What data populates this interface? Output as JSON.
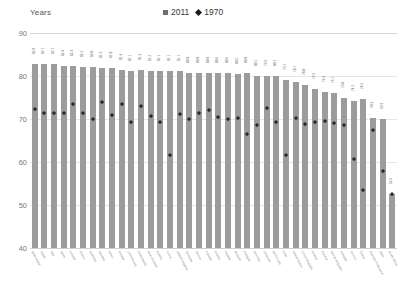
{
  "axis_title": "Years",
  "legend": [
    {
      "label": "2011",
      "marker": "square-icon",
      "color": "#6e6e6e"
    },
    {
      "label": "1970",
      "marker": "diamond-icon",
      "color": "#1a1a1a"
    }
  ],
  "y_ticks": [
    "90",
    "80",
    "70",
    "60",
    "50",
    "40"
  ],
  "chart_data": {
    "type": "bar",
    "title": "",
    "xlabel": "",
    "ylabel": "Years",
    "ylim": [
      40,
      90
    ],
    "yticks": [
      40,
      50,
      60,
      70,
      80,
      90
    ],
    "grid": true,
    "legend_position": "top-center",
    "categories": [
      "Switzerland",
      "Japan",
      "Italy",
      "Spain",
      "Iceland",
      "France",
      "Australia",
      "Sweden",
      "Israel",
      "Norway",
      "Luxembourg",
      "Netherlands",
      "New Zealand",
      "Austria",
      "Korea",
      "United Kingdom",
      "Germany",
      "Greece",
      "Canada",
      "Ireland",
      "Finland",
      "Belgium",
      "Portugal",
      "Slovenia",
      "Denmark",
      "OECD (34)",
      "Chile",
      "United States",
      "Czech Republic",
      "Poland",
      "Estonia",
      "Slovak Republic",
      "Hungary",
      "Mexico",
      "Turkey",
      "Russian Federation",
      "India",
      "South Africa"
    ],
    "series": [
      {
        "name": "2011",
        "type": "bar",
        "color": "#9c9c9c",
        "values": [
          82.8,
          82.7,
          82.7,
          82.4,
          82.4,
          82.2,
          82.0,
          81.9,
          81.8,
          81.4,
          81.1,
          81.3,
          81.2,
          81.1,
          81.1,
          81.1,
          80.8,
          80.8,
          80.8,
          80.6,
          80.6,
          80.5,
          80.8,
          80.1,
          79.9,
          80.1,
          79.1,
          78.7,
          78.0,
          76.9,
          76.3,
          76.1,
          75.0,
          74.2,
          74.6,
          70.3,
          69.9,
          52.6
        ]
      },
      {
        "name": "1970",
        "type": "marker",
        "color": "#2a2a2a",
        "values": [
          73.0,
          72.0,
          72.0,
          72.0,
          74.3,
          72.2,
          70.8,
          74.7,
          71.6,
          74.1,
          70.0,
          73.7,
          71.4,
          70.0,
          62.3,
          71.9,
          70.6,
          72.0,
          72.9,
          71.2,
          70.8,
          71.0,
          67.1,
          69.3,
          73.3,
          70.0,
          62.4,
          70.9,
          69.6,
          70.0,
          70.2,
          69.8,
          69.2,
          61.5,
          54.2,
          68.1,
          58.5,
          53.3
        ]
      }
    ]
  }
}
